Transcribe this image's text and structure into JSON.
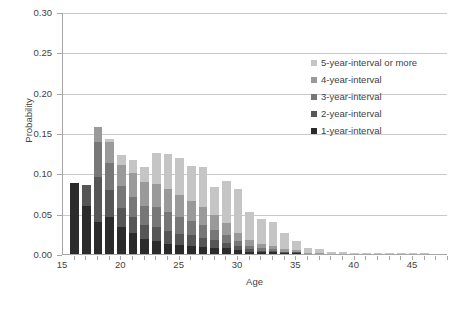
{
  "chart_data": {
    "type": "bar",
    "stacked": true,
    "title": "",
    "xlabel": "Age",
    "ylabel": "Probability",
    "xlim": [
      15,
      48
    ],
    "ylim": [
      0.0,
      0.3
    ],
    "ytick_labels": [
      "0.00",
      "0.05",
      "0.10",
      "0.15",
      "0.20",
      "0.25",
      "0.30"
    ],
    "ytick_values": [
      0.0,
      0.05,
      0.1,
      0.15,
      0.2,
      0.25,
      0.3
    ],
    "xtick_labels": [
      "15",
      "20",
      "25",
      "30",
      "35",
      "40",
      "45"
    ],
    "xtick_values": [
      15,
      20,
      25,
      30,
      35,
      40,
      45
    ],
    "grid": "horizontal",
    "legend_position": "top-right-inside",
    "categories": [
      16,
      17,
      18,
      19,
      20,
      21,
      22,
      23,
      24,
      25,
      26,
      27,
      28,
      29,
      30,
      31,
      32,
      33,
      34,
      35,
      36,
      37,
      38,
      39,
      40,
      41,
      42,
      43,
      44,
      45,
      46,
      47
    ],
    "series": [
      {
        "name": "1-year-interval",
        "color": "#2b2b2b",
        "values": [
          0.088,
          0.06,
          0.04,
          0.046,
          0.033,
          0.026,
          0.018,
          0.016,
          0.013,
          0.011,
          0.01,
          0.009,
          0.008,
          0.007,
          0.005,
          0.003,
          0.002,
          0.002,
          0.001,
          0.001,
          0.0,
          0.0,
          0.0,
          0.0,
          0.0,
          0.0,
          0.0,
          0.0,
          0.0,
          0.0,
          0.0,
          0.0
        ]
      },
      {
        "name": "2-year-interval",
        "color": "#565656",
        "values": [
          0.0,
          0.025,
          0.056,
          0.033,
          0.024,
          0.02,
          0.018,
          0.017,
          0.016,
          0.014,
          0.013,
          0.011,
          0.009,
          0.007,
          0.005,
          0.003,
          0.002,
          0.002,
          0.001,
          0.001,
          0.0,
          0.0,
          0.0,
          0.0,
          0.0,
          0.0,
          0.0,
          0.0,
          0.0,
          0.0,
          0.0,
          0.0
        ]
      },
      {
        "name": "3-year-interval",
        "color": "#777777",
        "values": [
          0.0,
          0.0,
          0.043,
          0.034,
          0.027,
          0.025,
          0.024,
          0.025,
          0.023,
          0.021,
          0.018,
          0.016,
          0.013,
          0.01,
          0.006,
          0.004,
          0.003,
          0.002,
          0.001,
          0.001,
          0.0,
          0.0,
          0.0,
          0.0,
          0.0,
          0.0,
          0.0,
          0.0,
          0.0,
          0.0,
          0.0,
          0.0
        ]
      },
      {
        "name": "4-year-interval",
        "color": "#9a9a9a",
        "values": [
          0.0,
          0.0,
          0.019,
          0.026,
          0.026,
          0.029,
          0.029,
          0.029,
          0.028,
          0.027,
          0.025,
          0.022,
          0.019,
          0.015,
          0.01,
          0.007,
          0.005,
          0.004,
          0.003,
          0.002,
          0.001,
          0.001,
          0.0,
          0.0,
          0.0,
          0.0,
          0.0,
          0.0,
          0.0,
          0.0,
          0.0,
          0.0
        ]
      },
      {
        "name": "5-year-interval or more",
        "color": "#c5c5c5",
        "values": [
          0.0,
          0.0,
          0.0,
          0.004,
          0.013,
          0.016,
          0.019,
          0.038,
          0.044,
          0.046,
          0.043,
          0.05,
          0.034,
          0.051,
          0.055,
          0.035,
          0.031,
          0.03,
          0.02,
          0.011,
          0.006,
          0.005,
          0.003,
          0.002,
          0.001,
          0.001,
          0.001,
          0.001,
          0.001,
          0.001,
          0.001,
          0.0
        ]
      }
    ],
    "totals": [
      0.088,
      0.085,
      0.158,
      0.143,
      0.123,
      0.116,
      0.108,
      0.125,
      0.124,
      0.119,
      0.109,
      0.108,
      0.083,
      0.09,
      0.081,
      0.052,
      0.043,
      0.04,
      0.026,
      0.016,
      0.007,
      0.006,
      0.003,
      0.002,
      0.001,
      0.001,
      0.001,
      0.001,
      0.001,
      0.001,
      0.001,
      0.0
    ]
  },
  "legend": {
    "items": [
      {
        "label": "5-year-interval or more",
        "color": "#c5c5c5"
      },
      {
        "label": "4-year-interval",
        "color": "#9a9a9a"
      },
      {
        "label": "3-year-interval",
        "color": "#777777"
      },
      {
        "label": "2-year-interval",
        "color": "#565656"
      },
      {
        "label": "1-year-interval",
        "color": "#2b2b2b"
      }
    ]
  },
  "axes": {
    "x_title": "Age",
    "y_title": "Probability"
  }
}
